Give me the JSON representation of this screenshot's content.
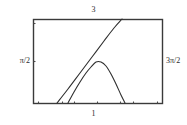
{
  "figure": {
    "name": "graphing-calculator-plot",
    "background": "#ffffff",
    "frame": {
      "color": "#3a3a3a",
      "x": 33,
      "y": 19,
      "width": 129,
      "height": 84
    },
    "labels": {
      "top": "3",
      "bottom": "1",
      "left": "π/2",
      "right": "3π/2"
    },
    "tick_color": "#4a4a4a",
    "ticks": {
      "bottom_x": [
        38,
        62,
        74,
        97,
        120,
        133,
        157
      ],
      "left_y": [
        23,
        61
      ],
      "right_y": [],
      "top_x": []
    }
  },
  "chart_data": {
    "type": "line",
    "title": "",
    "xlabel": "1",
    "ylabel": "π/2",
    "xlim": [
      0,
      1
    ],
    "ylim": [
      0,
      3
    ],
    "grid": false,
    "legend": null,
    "axis_annotations": {
      "top": "3",
      "bottom": "1",
      "left": "π/2",
      "right": "3π/2"
    },
    "series": [
      {
        "name": "rising-line",
        "color": "#2e2e2e",
        "style": "solid",
        "points_px": [
          [
            57,
            103
          ],
          [
            68,
            89
          ],
          [
            80,
            73
          ],
          [
            92,
            57
          ],
          [
            104,
            41
          ],
          [
            114,
            28
          ],
          [
            122,
            19
          ]
        ]
      },
      {
        "name": "arc-curve",
        "color": "#2e2e2e",
        "style": "solid",
        "points_px": [
          [
            68,
            103
          ],
          [
            74,
            92
          ],
          [
            80,
            82
          ],
          [
            86,
            73
          ],
          [
            91,
            67
          ],
          [
            96,
            62
          ],
          [
            101,
            62
          ],
          [
            106,
            66
          ],
          [
            111,
            74
          ],
          [
            116,
            84
          ],
          [
            121,
            95
          ],
          [
            125,
            103
          ]
        ]
      }
    ]
  }
}
